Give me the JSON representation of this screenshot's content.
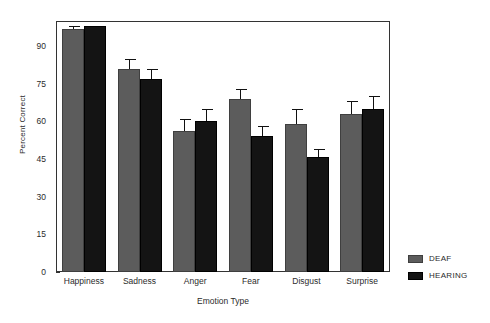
{
  "chart_data": {
    "type": "bar",
    "title": "",
    "xlabel": "Emotion Type",
    "ylabel": "Percent Correct",
    "categories": [
      "Happiness",
      "Sadness",
      "Anger",
      "Fear",
      "Disgust",
      "Surprise"
    ],
    "series": [
      {
        "name": "DEAF",
        "color": "#5c5c5c",
        "values": [
          97,
          81,
          56,
          69,
          59,
          63
        ],
        "errors": [
          1,
          4,
          5,
          4,
          6,
          5
        ]
      },
      {
        "name": "HEARING",
        "color": "#141414",
        "values": [
          98,
          77,
          60,
          54,
          46,
          65
        ]
      }
    ],
    "errors_hearing": [
      0,
      4,
      5,
      4,
      3,
      5
    ],
    "ylim": [
      0,
      100
    ],
    "yticks": [
      0,
      15,
      30,
      45,
      60,
      75,
      90
    ],
    "ytick_labels": [
      "0",
      "15",
      "30",
      "45",
      "60",
      "75",
      "90"
    ],
    "grid": false,
    "legend_position": "right",
    "legend": [
      "DEAF",
      "HEARING"
    ]
  },
  "axis": {
    "y_title": "Percent Correct",
    "x_title": "Emotion Type"
  },
  "legend": {
    "items": [
      {
        "label": "DEAF",
        "swatch": "gray-swatch"
      },
      {
        "label": "HEARING",
        "swatch": "black-swatch"
      }
    ]
  }
}
